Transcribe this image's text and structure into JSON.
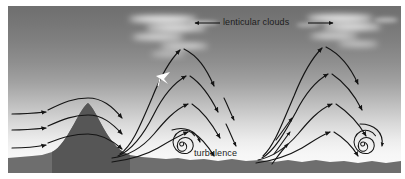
{
  "figure": {
    "labels": {
      "lenticular_clouds": "lenticular clouds",
      "turbulence": "turbulence"
    },
    "colors": {
      "sky_top": "#6f6f6f",
      "sky_bottom": "#fbfbfb",
      "ground": "#6e6e6e",
      "mountain": "#5a5a5a",
      "cloud": "#ffffff",
      "streamline": "#141414",
      "text": "#1c1c1c",
      "page": "#ffffff"
    },
    "elements": {
      "wind_direction_arrow_left": "arrow-left",
      "wind_direction_arrow_right": "arrow-right",
      "glider": "glider-icon",
      "vortex_left": "spiral-icon",
      "vortex_right": "spiral-icon"
    },
    "counts": {
      "inflow_arrows": 3,
      "lenticular_cloud_stacks": 2,
      "wave_crests": 3,
      "rotor_vortices": 2
    }
  }
}
